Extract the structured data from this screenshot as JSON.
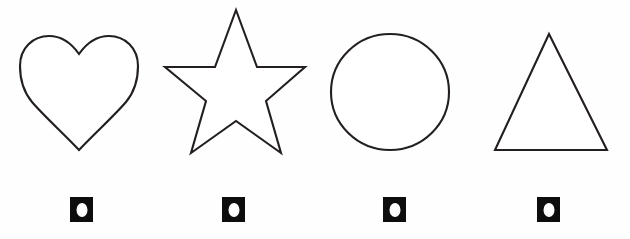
{
  "page": {
    "background_color": "#fefefe",
    "stroke_color": "#231f20",
    "fill_color": "#ffffff",
    "width": 630,
    "height": 239
  },
  "shapes": [
    {
      "name": "heart",
      "label": "Heart",
      "icon": "heart-outline-icon",
      "outline_color": "#231f20",
      "fill": "#ffffff",
      "bounds": {
        "x": 20,
        "y": 36,
        "width": 118,
        "height": 114
      }
    },
    {
      "name": "star",
      "label": "Star",
      "icon": "star-outline-icon",
      "outline_color": "#231f20",
      "fill": "#ffffff",
      "points": 5,
      "bounds": {
        "x": 165,
        "y": 10,
        "width": 140,
        "height": 143
      }
    },
    {
      "name": "circle",
      "label": "Circle",
      "icon": "circle-outline-icon",
      "outline_color": "#231f20",
      "fill": "#ffffff",
      "bounds": {
        "x": 330,
        "y": 33,
        "width": 120,
        "height": 118
      }
    },
    {
      "name": "triangle",
      "label": "Triangle",
      "icon": "triangle-outline-icon",
      "outline_color": "#231f20",
      "fill": "#ffffff",
      "bounds": {
        "x": 495,
        "y": 34,
        "width": 113,
        "height": 116
      }
    }
  ],
  "markers": [
    {
      "name": "marker-heart",
      "icon": "square-with-white-dot-icon",
      "square_color": "#0d0d0d",
      "dot_color": "#ffffff",
      "for_shape": "heart"
    },
    {
      "name": "marker-star",
      "icon": "square-with-white-dot-icon",
      "square_color": "#0d0d0d",
      "dot_color": "#ffffff",
      "for_shape": "star"
    },
    {
      "name": "marker-circle",
      "icon": "square-with-white-dot-icon",
      "square_color": "#0d0d0d",
      "dot_color": "#ffffff",
      "for_shape": "circle"
    },
    {
      "name": "marker-triangle",
      "icon": "square-with-white-dot-icon",
      "square_color": "#0d0d0d",
      "dot_color": "#ffffff",
      "for_shape": "triangle"
    }
  ]
}
